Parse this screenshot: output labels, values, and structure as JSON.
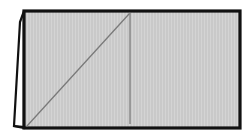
{
  "figure": {
    "canvas": {
      "width": 249,
      "height": 137,
      "background": "#ffffff"
    },
    "colors": {
      "outline": "#111111",
      "panel_fill": "#c9c9c9",
      "panel_stripe": "#d4d4d4",
      "flap_fill": "#ffffff",
      "inner_line": "#6f6f6f",
      "diagonal_line": "#7a7a7a"
    },
    "stroke_widths": {
      "outer_border": 3.2,
      "flap_border": 2.2,
      "inner_line": 1.1
    },
    "shapes": [
      {
        "name": "main-panel",
        "kind": "rectangle",
        "fill": "#c9c9c9",
        "stroke": "#111111",
        "points": "24,11 240,11 240,128 24,128"
      },
      {
        "name": "back-flap",
        "kind": "quadrilateral",
        "fill": "#ffffff",
        "stroke": "#111111",
        "points": "24,11 24,128 14,126 20,22"
      },
      {
        "name": "fold-line",
        "kind": "line",
        "stroke": "#6f6f6f",
        "points": "130,13 130,124"
      },
      {
        "name": "diagonal-crease",
        "kind": "line",
        "stroke": "#7a7a7a",
        "points": "27,126 129,14"
      },
      {
        "name": "flap-foot",
        "kind": "line",
        "stroke": "#111111",
        "points": "14,126 24,126"
      }
    ],
    "labels": {
      "caption": "",
      "annotations": []
    }
  }
}
